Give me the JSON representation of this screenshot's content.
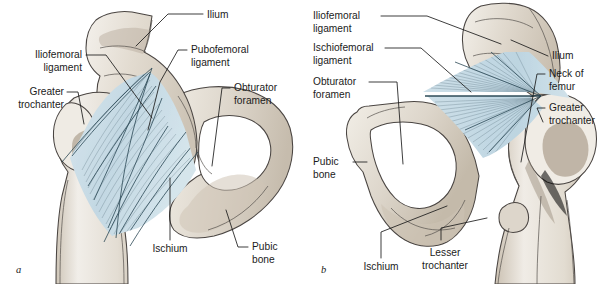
{
  "figure": {
    "background_color": "#ffffff",
    "bone_color": "#ded7cc",
    "bone_highlight": "#f2eee7",
    "bone_shadow": "#b9ae9f",
    "outline_color": "#4a4542",
    "ligament_color": "#cadde6",
    "ligament_fiber_color": "#3d5663",
    "label_color": "#1b1b1b"
  },
  "panels": [
    {
      "id": "a",
      "letter": "a",
      "view": "anterior",
      "labels": [
        {
          "key": "ilium",
          "text_lines": [
            "Ilium"
          ]
        },
        {
          "key": "iliofemoral-ligament",
          "text_lines": [
            "Iliofemoral",
            "ligament"
          ]
        },
        {
          "key": "pubofemoral-ligament",
          "text_lines": [
            "Pubofemoral",
            "ligament"
          ]
        },
        {
          "key": "greater-trochanter",
          "text_lines": [
            "Greater",
            "trochanter"
          ]
        },
        {
          "key": "obturator-foramen",
          "text_lines": [
            "Obturator",
            "foramen"
          ]
        },
        {
          "key": "ischium",
          "text_lines": [
            "Ischium"
          ]
        },
        {
          "key": "pubic-bone",
          "text_lines": [
            "Pubic",
            "bone"
          ]
        }
      ]
    },
    {
      "id": "b",
      "letter": "b",
      "view": "posterior",
      "labels": [
        {
          "key": "iliofemoral-ligament",
          "text_lines": [
            "Iliofemoral",
            "ligament"
          ]
        },
        {
          "key": "ischiofemoral-ligament",
          "text_lines": [
            "Ischiofemoral",
            "ligament"
          ]
        },
        {
          "key": "obturator-foramen",
          "text_lines": [
            "Obturator",
            "foramen"
          ]
        },
        {
          "key": "pubic-bone",
          "text_lines": [
            "Pubic",
            "bone"
          ]
        },
        {
          "key": "ilium",
          "text_lines": [
            "Ilium"
          ]
        },
        {
          "key": "neck-of-femur",
          "text_lines": [
            "Neck of",
            "femur"
          ]
        },
        {
          "key": "greater-trochanter",
          "text_lines": [
            "Greater",
            "trochanter"
          ]
        },
        {
          "key": "ischium",
          "text_lines": [
            "Ischium"
          ]
        },
        {
          "key": "lesser-trochanter",
          "text_lines": [
            "Lesser",
            "trochanter"
          ]
        }
      ]
    }
  ],
  "panel_a_text": {
    "ilium": "Ilium",
    "iliofemoral_1": "Iliofemoral",
    "iliofemoral_2": "ligament",
    "pubofemoral_1": "Pubofemoral",
    "pubofemoral_2": "ligament",
    "greater_1": "Greater",
    "greater_2": "trochanter",
    "obturator_1": "Obturator",
    "obturator_2": "foramen",
    "ischium": "Ischium",
    "pubic_1": "Pubic",
    "pubic_2": "bone",
    "letter": "a"
  },
  "panel_b_text": {
    "iliofemoral_1": "Iliofemoral",
    "iliofemoral_2": "ligament",
    "ischiofemoral_1": "Ischiofemoral",
    "ischiofemoral_2": "ligament",
    "obturator_1": "Obturator",
    "obturator_2": "foramen",
    "pubic_1": "Pubic",
    "pubic_2": "bone",
    "ilium": "Ilium",
    "neck_1": "Neck of",
    "neck_2": "femur",
    "greater_1": "Greater",
    "greater_2": "trochanter",
    "ischium": "Ischium",
    "lesser_1": "Lesser",
    "lesser_2": "trochanter",
    "letter": "b"
  }
}
